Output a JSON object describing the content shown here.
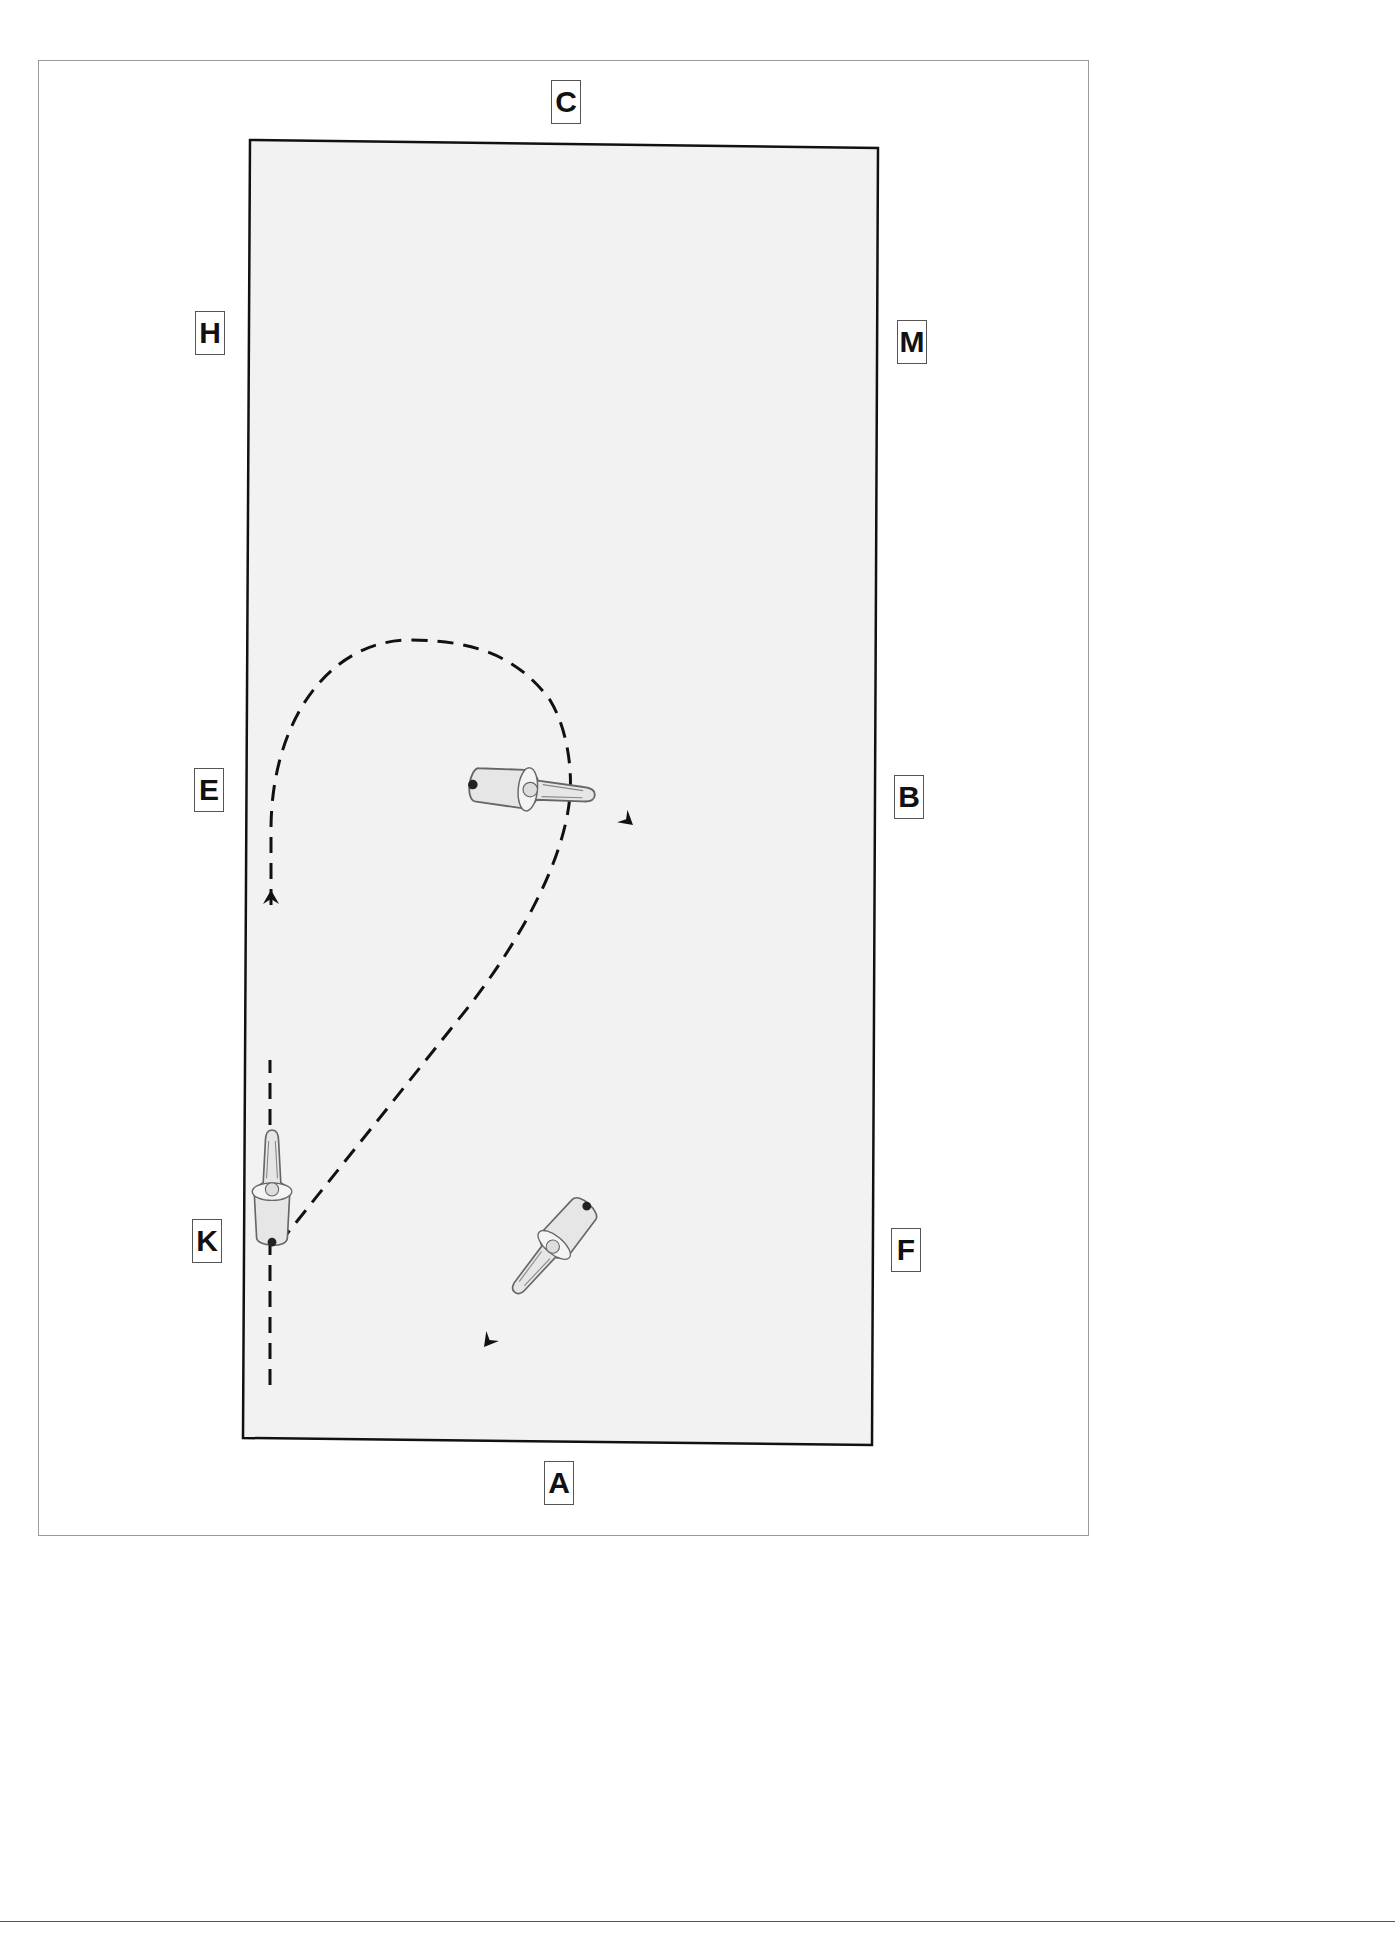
{
  "diagram": {
    "type": "dressage-arena-figure",
    "arena": {
      "fill": "#f2f2f2",
      "border": "#111111",
      "corners": {
        "tl": [
          250,
          140
        ],
        "tr": [
          878,
          148
        ],
        "br": [
          872,
          1445
        ],
        "bl": [
          243,
          1438
        ]
      }
    },
    "markers": [
      {
        "letter": "C",
        "x": 566,
        "y": 102
      },
      {
        "letter": "H",
        "x": 210,
        "y": 333
      },
      {
        "letter": "M",
        "x": 912,
        "y": 342
      },
      {
        "letter": "E",
        "x": 209,
        "y": 790
      },
      {
        "letter": "B",
        "x": 909,
        "y": 797
      },
      {
        "letter": "K",
        "x": 207,
        "y": 1241
      },
      {
        "letter": "F",
        "x": 906,
        "y": 1250
      },
      {
        "letter": "A",
        "x": 559,
        "y": 1483
      }
    ],
    "path": {
      "style": "dashed",
      "color": "#111111",
      "description": "Track up the long side from near A/K, half-circle turn toward B, return on diagonal toward K"
    },
    "arrows": [
      {
        "name": "arrow-up-track",
        "direction": "up"
      },
      {
        "name": "arrow-top-curve",
        "direction": "down-right"
      },
      {
        "name": "arrow-diagonal",
        "direction": "down-left"
      }
    ],
    "riders": [
      {
        "name": "horse-rider-track",
        "heading": "north"
      },
      {
        "name": "horse-rider-turn",
        "heading": "east"
      },
      {
        "name": "horse-rider-diagonal",
        "heading": "south-west"
      }
    ]
  }
}
